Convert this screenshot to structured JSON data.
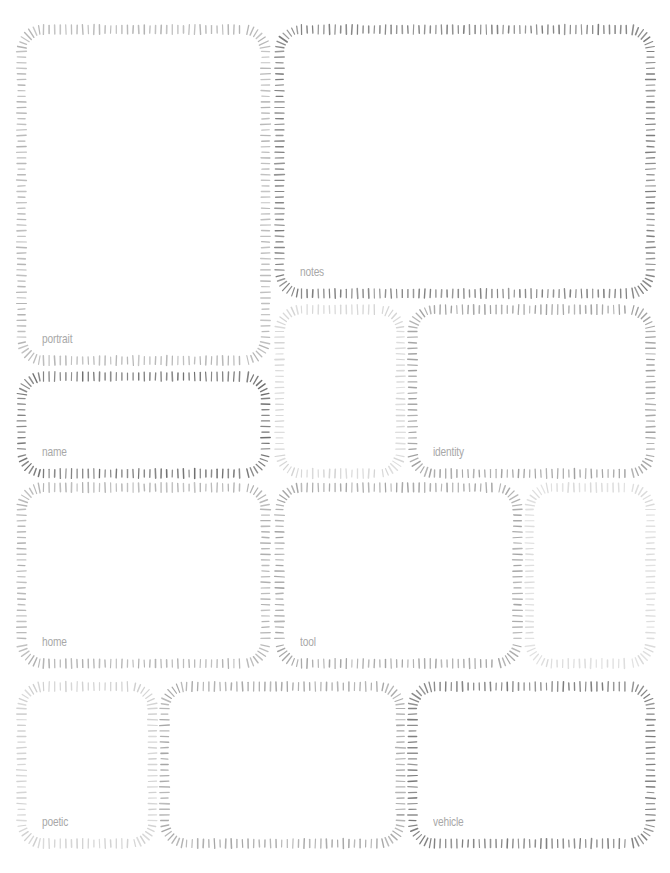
{
  "page": {
    "width": 670,
    "height": 873,
    "background": "#ffffff",
    "label_color": "#a8a8a8"
  },
  "frames": [
    {
      "id": "portrait",
      "label": "portrait",
      "x": 17,
      "y": 25,
      "w": 253,
      "h": 340,
      "color": "#b4b4b4"
    },
    {
      "id": "notes",
      "label": "notes",
      "x": 275,
      "y": 25,
      "w": 380,
      "h": 273,
      "color": "#7c7c7c"
    },
    {
      "id": "name",
      "label": "name",
      "x": 17,
      "y": 372,
      "w": 253,
      "h": 106,
      "color": "#6e6e6e"
    },
    {
      "id": "blank-a",
      "label": "",
      "x": 275,
      "y": 305,
      "w": 130,
      "h": 173,
      "color": "#d4d4d4"
    },
    {
      "id": "identity",
      "label": "identity",
      "x": 408,
      "y": 305,
      "w": 247,
      "h": 173,
      "color": "#a0a0a0"
    },
    {
      "id": "home",
      "label": "home",
      "x": 17,
      "y": 483,
      "w": 253,
      "h": 185,
      "color": "#b0b0b0"
    },
    {
      "id": "tool",
      "label": "tool",
      "x": 275,
      "y": 483,
      "w": 247,
      "h": 185,
      "color": "#a4a4a4"
    },
    {
      "id": "blank-b",
      "label": "",
      "x": 525,
      "y": 483,
      "w": 130,
      "h": 185,
      "color": "#dadada"
    },
    {
      "id": "poetic",
      "label": "poetic",
      "x": 17,
      "y": 682,
      "w": 140,
      "h": 166,
      "color": "#d0d0d0"
    },
    {
      "id": "blank-c",
      "label": "",
      "x": 160,
      "y": 682,
      "w": 245,
      "h": 166,
      "color": "#a6a6a6"
    },
    {
      "id": "vehicle",
      "label": "vehicle",
      "x": 408,
      "y": 682,
      "w": 247,
      "h": 166,
      "color": "#7a7a7a"
    }
  ]
}
